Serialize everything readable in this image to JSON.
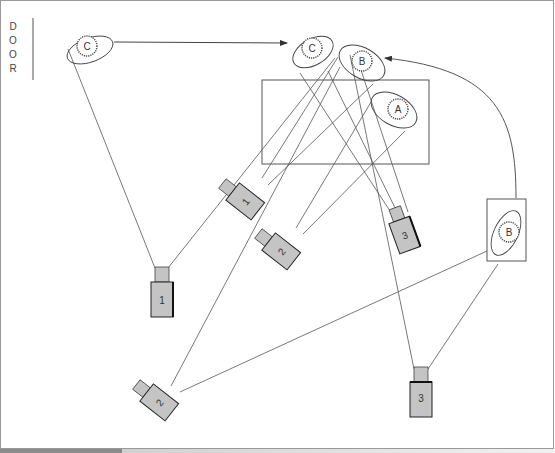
{
  "door": {
    "letters": [
      "D",
      "O",
      "O",
      "R"
    ]
  },
  "people": [
    {
      "id": "c-start",
      "label": "C",
      "x": 87,
      "y": 19
    },
    {
      "id": "c-end",
      "label": "C",
      "x": 312,
      "y": 44
    },
    {
      "id": "b-end",
      "label": "B",
      "x": 362,
      "y": 59
    },
    {
      "id": "a",
      "label": "A",
      "x": 394,
      "y": 106
    },
    {
      "id": "b-start",
      "label": "B",
      "x": 509,
      "y": 233
    }
  ],
  "cameras": [
    {
      "label": "1",
      "x": 160,
      "y": 305,
      "angle": 0
    },
    {
      "label": "1",
      "x": 248,
      "y": 198,
      "angle": -50
    },
    {
      "label": "2",
      "x": 283,
      "y": 248,
      "angle": -50
    },
    {
      "label": "3",
      "x": 403,
      "y": 235,
      "angle": -20
    },
    {
      "label": "2",
      "x": 161,
      "y": 399,
      "angle": -50
    },
    {
      "label": "3",
      "x": 421,
      "y": 405,
      "angle": 0
    }
  ],
  "colors": {
    "line": "#555555",
    "camera_fill": "#c4c4c4",
    "camera_border": "#333333",
    "person_outline": "#444444"
  }
}
